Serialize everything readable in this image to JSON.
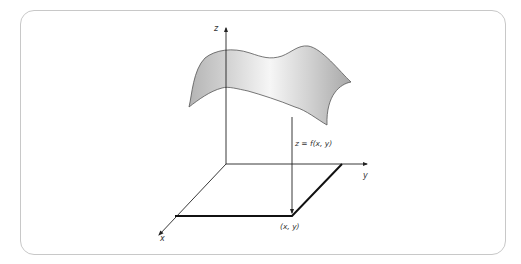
{
  "diagram": {
    "axes": {
      "x_label": "x",
      "y_label": "y",
      "z_label": "z"
    },
    "annotations": {
      "function_label": "z = f(x, y)",
      "point_label": "(x, y)"
    },
    "colors": {
      "axis": "#222222",
      "frame_border": "#c8c8c8",
      "surface_light": "#f4f4f4",
      "surface_dark": "#b8b8b8",
      "surface_edge": "#555555",
      "domain_edge": "#111111"
    }
  }
}
